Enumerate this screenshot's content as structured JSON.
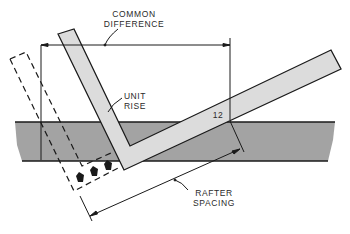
{
  "diagram": {
    "labels": {
      "common_difference": [
        "COMMON",
        "DIFFERENCE"
      ],
      "unit_rise": [
        "UNIT",
        "RISE"
      ],
      "twelve": "12",
      "rafter_spacing": [
        "RAFTER",
        "SPACING"
      ]
    },
    "colors": {
      "band": "#a3a3a3",
      "square": "#dcdcdc",
      "line": "#1a1a1a",
      "background": "#ffffff"
    }
  }
}
